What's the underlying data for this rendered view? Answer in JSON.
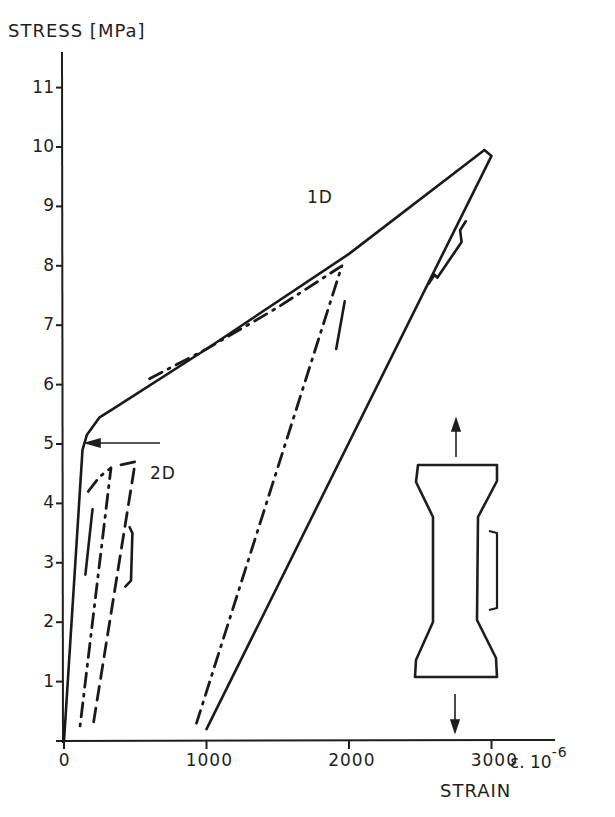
{
  "chart_data": {
    "type": "line",
    "title": "",
    "ylabel": "STRESS [MPa]",
    "xlabel": "STRAIN",
    "x_unit": "ε. 10⁻⁶",
    "x_unit_base": "3000 ε. 10",
    "x_unit_exp": "-6",
    "xlim": [
      0,
      3400
    ],
    "ylim": [
      0,
      11.5
    ],
    "xticks": [
      0,
      1000,
      2000,
      3000
    ],
    "xtick_labels": [
      "0",
      "1000",
      "2000",
      "3000"
    ],
    "yticks": [
      1,
      2,
      3,
      4,
      5,
      6,
      7,
      8,
      9,
      10,
      11
    ],
    "grid": false,
    "legend": "none",
    "annotations": [
      {
        "text": "1D",
        "x": 1700,
        "y": 9.2
      },
      {
        "text": "2D",
        "x": 700,
        "y": 4.55
      },
      {
        "text": "arrow pointing to yield knee",
        "from": [
          700,
          4.9
        ],
        "to": [
          170,
          4.9
        ]
      }
    ],
    "series": [
      {
        "name": "1D loading/unloading (solid)",
        "style": "solid",
        "points": [
          [
            0,
            0
          ],
          [
            130,
            4.9
          ],
          [
            160,
            5.15
          ],
          [
            250,
            5.45
          ],
          [
            350,
            5.6
          ],
          [
            1000,
            6.6
          ],
          [
            2000,
            8.2
          ],
          [
            2950,
            9.95
          ],
          [
            3000,
            9.85
          ],
          [
            1000,
            0.2
          ]
        ]
      },
      {
        "name": "1D partial cycle (dash-dot)",
        "style": "dash-dot",
        "points": [
          [
            600,
            6.1
          ],
          [
            1000,
            6.6
          ],
          [
            1500,
            7.3
          ],
          [
            1950,
            8.0
          ],
          [
            930,
            0.3
          ]
        ]
      },
      {
        "name": "2D cycle A (dash-dot)",
        "style": "dash-dot",
        "points": [
          [
            170,
            4.2
          ],
          [
            250,
            4.45
          ],
          [
            330,
            4.6
          ],
          [
            110,
            0.2
          ]
        ]
      },
      {
        "name": "2D cycle B (dashed)",
        "style": "dashed",
        "points": [
          [
            400,
            4.65
          ],
          [
            500,
            4.7
          ],
          [
            200,
            0.2
          ]
        ]
      }
    ],
    "extensometer_marks": [
      {
        "name": "1D unloading gauge",
        "points": [
          [
            2560,
            7.7
          ],
          [
            2600,
            7.85
          ],
          [
            2620,
            7.8
          ],
          [
            2790,
            8.4
          ],
          [
            2780,
            8.6
          ],
          [
            2820,
            8.75
          ]
        ]
      },
      {
        "name": "1D dash-dot gauge",
        "points": [
          [
            1910,
            6.6
          ],
          [
            1970,
            7.4
          ]
        ]
      },
      {
        "name": "2D gauge",
        "points": [
          [
            430,
            2.6
          ],
          [
            470,
            2.7
          ],
          [
            480,
            3.5
          ],
          [
            460,
            3.6
          ]
        ]
      },
      {
        "name": "2D short dash",
        "points": [
          [
            150,
            2.8
          ],
          [
            200,
            3.9
          ]
        ]
      }
    ],
    "inset": {
      "description": "dog-bone tensile specimen with tension arrows up and down, and a measuring bracket on the right side of the gauge section"
    }
  }
}
